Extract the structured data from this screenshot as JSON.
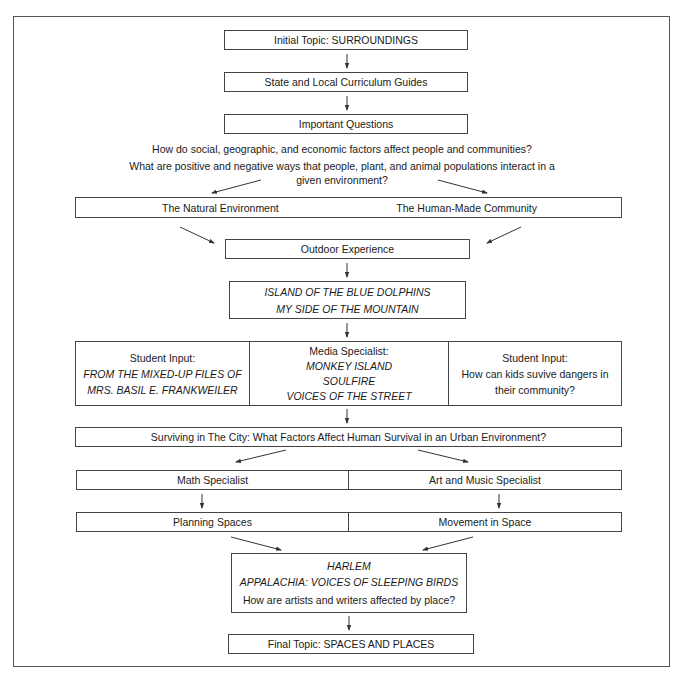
{
  "diagram": {
    "initial_topic": "Initial Topic: SURROUNDINGS",
    "curriculum_guides": "State and Local Curriculum Guides",
    "important_questions": "Important Questions",
    "questions": {
      "q1": "How do social, geographic, and economic factors affect people and communities?",
      "q2_line1": "What are positive and negative ways that people, plant, and animal populations interact in a",
      "q2_line2": "given environment?"
    },
    "environments": {
      "natural": "The Natural Environment",
      "human_made": "The Human-Made Community"
    },
    "outdoor_experience": "Outdoor Experience",
    "books_1": {
      "line1": "ISLAND OF THE BLUE DOLPHINS",
      "line2": "MY SIDE OF THE MOUNTAIN"
    },
    "inputs": {
      "left": {
        "heading": "Student Input:",
        "line1": "FROM THE MIXED-UP FILES OF",
        "line2": "MRS. BASIL E. FRANKWEILER"
      },
      "middle": {
        "heading": "Media Specialist:",
        "line1": "MONKEY ISLAND",
        "line2": "SOULFIRE",
        "line3": "VOICES OF THE STREET"
      },
      "right": {
        "heading": "Student Input:",
        "line1": "How can kids suvive dangers in",
        "line2": "their community?"
      }
    },
    "surviving_city": "Surviving in The City: What Factors Affect Human Survival in an Urban Environment?",
    "specialists": {
      "math": "Math Specialist",
      "art_music": "Art and Music Specialist"
    },
    "activities": {
      "planning": "Planning Spaces",
      "movement": "Movement in Space"
    },
    "books_2": {
      "line1": "HARLEM",
      "line2": "APPALACHIA: VOICES OF SLEEPING BIRDS",
      "question": "How are artists and writers affected by place?"
    },
    "final_topic": "Final Topic: SPACES AND PLACES"
  },
  "colors": {
    "line": "#444444",
    "text": "#1a1a1a",
    "background": "#ffffff"
  }
}
